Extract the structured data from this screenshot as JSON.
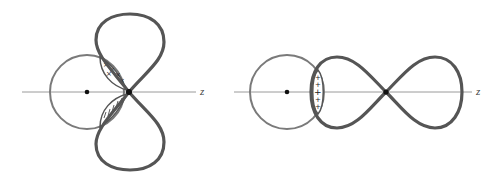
{
  "diagrams": [
    {
      "id": "left",
      "description": "s orbital overlapping p orbital perpendicular to z-axis",
      "axis_label": "z",
      "overlap_regions": [
        {
          "position": "upper",
          "sign_symbol": "×"
        },
        {
          "position": "lower",
          "sign_symbol": "/"
        }
      ]
    },
    {
      "id": "right",
      "description": "s orbital overlapping p orbital along z-axis",
      "axis_label": "z",
      "overlap_regions": [
        {
          "position": "center",
          "sign_symbol": "+"
        }
      ]
    }
  ],
  "colors": {
    "axis": "#9a9a9a",
    "s_orbital": "#7a7a7a",
    "p_orbital": "#555555",
    "nucleus": "#111111"
  }
}
